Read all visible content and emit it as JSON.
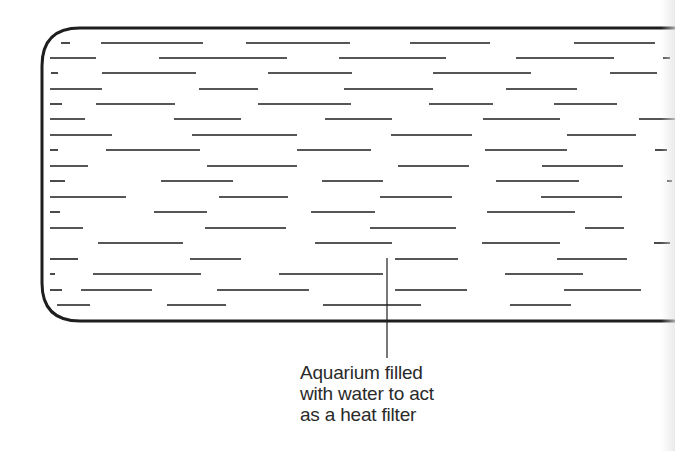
{
  "diagram": {
    "colors": {
      "ink": "#1e1e1e",
      "background": "#ffffff",
      "text": "#2a2a2a"
    },
    "tank": {
      "x": 42,
      "y": 28,
      "right": 675,
      "bottom": 321,
      "corner_radius": 38,
      "stroke_width": 3
    },
    "callout": {
      "label_lines": [
        "Aquarium filled",
        "with water to act",
        "as a heat filter"
      ],
      "leader_x": 387,
      "leader_top": 258,
      "leader_bottom": 358
    },
    "water_rows": [
      {
        "y": 43,
        "segments": [
          [
            61,
            70
          ],
          [
            101,
            203
          ],
          [
            246,
            350
          ],
          [
            410,
            490
          ],
          [
            574,
            655
          ]
        ]
      },
      {
        "y": 58,
        "segments": [
          [
            50,
            96
          ],
          [
            159,
            287
          ],
          [
            339,
            446
          ],
          [
            516,
            614
          ],
          [
            663,
            670
          ]
        ]
      },
      {
        "y": 73,
        "segments": [
          [
            51,
            58
          ],
          [
            102,
            196
          ],
          [
            268,
            352
          ],
          [
            433,
            531
          ],
          [
            610,
            657
          ]
        ]
      },
      {
        "y": 89,
        "segments": [
          [
            50,
            102
          ],
          [
            199,
            258
          ],
          [
            344,
            433
          ],
          [
            506,
            577
          ]
        ]
      },
      {
        "y": 104,
        "segments": [
          [
            50,
            62
          ],
          [
            96,
            175
          ],
          [
            258,
            351
          ],
          [
            429,
            493
          ],
          [
            554,
            617
          ]
        ]
      },
      {
        "y": 119,
        "segments": [
          [
            50,
            85
          ],
          [
            174,
            241
          ],
          [
            325,
            392
          ],
          [
            483,
            560
          ],
          [
            639,
            675
          ]
        ]
      },
      {
        "y": 135,
        "segments": [
          [
            50,
            112
          ],
          [
            192,
            297
          ],
          [
            391,
            472
          ],
          [
            567,
            636
          ]
        ]
      },
      {
        "y": 150,
        "segments": [
          [
            50,
            58
          ],
          [
            106,
            200
          ],
          [
            297,
            371
          ],
          [
            485,
            567
          ],
          [
            655,
            667
          ]
        ]
      },
      {
        "y": 166,
        "segments": [
          [
            50,
            88
          ],
          [
            207,
            297
          ],
          [
            398,
            469
          ],
          [
            542,
            623
          ]
        ]
      },
      {
        "y": 181,
        "segments": [
          [
            50,
            65
          ],
          [
            161,
            233
          ],
          [
            322,
            383
          ],
          [
            496,
            579
          ],
          [
            667,
            672
          ]
        ]
      },
      {
        "y": 197,
        "segments": [
          [
            50,
            126
          ],
          [
            219,
            288
          ],
          [
            380,
            452
          ],
          [
            541,
            622
          ]
        ]
      },
      {
        "y": 212,
        "segments": [
          [
            50,
            60
          ],
          [
            154,
            207
          ],
          [
            311,
            375
          ],
          [
            487,
            575
          ]
        ]
      },
      {
        "y": 228,
        "segments": [
          [
            50,
            83
          ],
          [
            205,
            286
          ],
          [
            370,
            456
          ],
          [
            585,
            624
          ]
        ]
      },
      {
        "y": 243,
        "segments": [
          [
            98,
            183
          ],
          [
            315,
            392
          ],
          [
            482,
            560
          ],
          [
            654,
            670
          ]
        ]
      },
      {
        "y": 259,
        "segments": [
          [
            50,
            78
          ],
          [
            190,
            241
          ],
          [
            395,
            458
          ],
          [
            557,
            627
          ]
        ]
      },
      {
        "y": 274,
        "segments": [
          [
            50,
            55
          ],
          [
            93,
            201
          ],
          [
            279,
            383
          ],
          [
            505,
            583
          ]
        ]
      },
      {
        "y": 290,
        "segments": [
          [
            50,
            62
          ],
          [
            81,
            152
          ],
          [
            217,
            309
          ],
          [
            395,
            467
          ],
          [
            564,
            641
          ]
        ]
      },
      {
        "y": 305,
        "segments": [
          [
            57,
            90
          ],
          [
            167,
            226
          ],
          [
            323,
            421
          ],
          [
            510,
            571
          ]
        ]
      }
    ]
  }
}
